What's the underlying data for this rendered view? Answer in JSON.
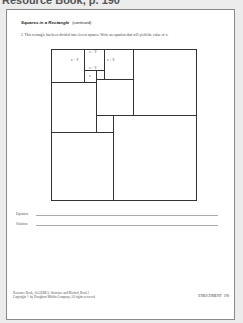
{
  "header": {
    "title": "Resource Book, p. 190"
  },
  "worksheet": {
    "heading": "Squares in a Rectangle",
    "heading_note": "(continued)",
    "problem": "2. This rectangle has been divided into eleven squares. Write an equation that will yield the value of x.",
    "labels": {
      "top_square_top": "x + 9",
      "left_square": "x + 9",
      "right_square": "x + 9",
      "top_square_bottom": "x + 9",
      "small_square": "x"
    },
    "answers": {
      "equation_label": "Equation",
      "solution_label": "Solution"
    },
    "footer": {
      "line1": "Resource Book, ALGEBRA: Structure and Method, Book 1",
      "line2": "Copyright © by Houghton Mifflin Company. All rights reserved.",
      "section": "ENRICHMENT",
      "page_number": "190"
    }
  }
}
